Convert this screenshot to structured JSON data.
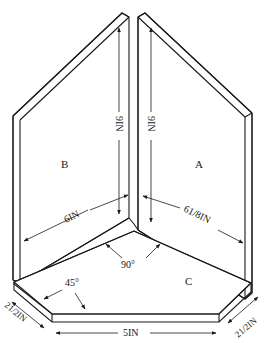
{
  "panels": {
    "a": {
      "label": "A",
      "height": "9IN",
      "width": "6 1/8IN"
    },
    "b": {
      "label": "B",
      "height": "9IN",
      "width": "6IN"
    },
    "c": {
      "label": "C",
      "front": "5IN",
      "left_side": "2 1/2IN",
      "right_side": "2 1/2IN"
    }
  },
  "angles": {
    "corner": "90°",
    "bevel": "45°"
  },
  "dims": {
    "b_height": "9IN",
    "a_height": "9IN",
    "b_width": "6IN",
    "a_width": "61/8IN",
    "front": "5IN",
    "left_side": "21/2IN",
    "right_side": "21/2IN",
    "corner": "90°",
    "bevel": "45°"
  },
  "colors": {
    "ink": "#1a1a1a",
    "paper": "#ffffff"
  }
}
